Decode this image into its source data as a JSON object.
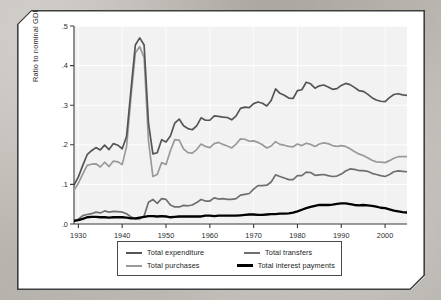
{
  "chart_data": {
    "type": "line",
    "title": "",
    "xlabel": "",
    "ylabel": "Ratio to nominal GDP",
    "xlim": [
      1929,
      2005
    ],
    "ylim": [
      0.0,
      0.5
    ],
    "xticks": [
      1930,
      1940,
      1950,
      1960,
      1970,
      1980,
      1990,
      2000
    ],
    "xtick_labels": [
      "1930",
      "1940",
      "1950",
      "1960",
      "1970",
      "1980",
      "1990",
      "2000"
    ],
    "yticks": [
      0.0,
      0.1,
      0.2,
      0.3,
      0.4,
      0.5
    ],
    "ytick_labels": [
      ".0",
      ".1",
      ".2",
      ".3",
      ".4",
      ".5"
    ],
    "grid": true,
    "legend_position": "below-center",
    "x": [
      1929,
      1930,
      1931,
      1932,
      1933,
      1934,
      1935,
      1936,
      1937,
      1938,
      1939,
      1940,
      1941,
      1942,
      1943,
      1944,
      1945,
      1946,
      1947,
      1948,
      1949,
      1950,
      1951,
      1952,
      1953,
      1954,
      1955,
      1956,
      1957,
      1958,
      1959,
      1960,
      1961,
      1962,
      1963,
      1964,
      1965,
      1966,
      1967,
      1968,
      1969,
      1970,
      1971,
      1972,
      1973,
      1974,
      1975,
      1976,
      1977,
      1978,
      1979,
      1980,
      1981,
      1982,
      1983,
      1984,
      1985,
      1986,
      1987,
      1988,
      1989,
      1990,
      1991,
      1992,
      1993,
      1994,
      1995,
      1996,
      1997,
      1998,
      1999,
      2000,
      2001,
      2002,
      2003,
      2004,
      2005
    ],
    "series": [
      {
        "name": "Total expenditure",
        "color": "#555555",
        "width": 1.7,
        "values": [
          0.098,
          0.119,
          0.148,
          0.175,
          0.185,
          0.193,
          0.187,
          0.199,
          0.188,
          0.203,
          0.199,
          0.19,
          0.221,
          0.338,
          0.452,
          0.47,
          0.452,
          0.255,
          0.177,
          0.18,
          0.213,
          0.207,
          0.222,
          0.255,
          0.265,
          0.248,
          0.241,
          0.238,
          0.248,
          0.268,
          0.262,
          0.262,
          0.273,
          0.272,
          0.27,
          0.269,
          0.263,
          0.273,
          0.292,
          0.295,
          0.294,
          0.304,
          0.308,
          0.305,
          0.298,
          0.312,
          0.341,
          0.33,
          0.325,
          0.318,
          0.317,
          0.337,
          0.339,
          0.358,
          0.354,
          0.343,
          0.349,
          0.351,
          0.346,
          0.34,
          0.342,
          0.35,
          0.355,
          0.352,
          0.345,
          0.337,
          0.335,
          0.328,
          0.319,
          0.313,
          0.31,
          0.309,
          0.319,
          0.327,
          0.329,
          0.326,
          0.325
        ]
      },
      {
        "name": "Total purchases",
        "color": "#9a9a9a",
        "width": 1.7,
        "values": [
          0.085,
          0.103,
          0.126,
          0.148,
          0.151,
          0.152,
          0.144,
          0.156,
          0.145,
          0.159,
          0.157,
          0.15,
          0.196,
          0.32,
          0.432,
          0.448,
          0.42,
          0.21,
          0.12,
          0.125,
          0.155,
          0.15,
          0.185,
          0.213,
          0.212,
          0.19,
          0.18,
          0.179,
          0.188,
          0.202,
          0.196,
          0.193,
          0.203,
          0.206,
          0.201,
          0.197,
          0.192,
          0.202,
          0.215,
          0.214,
          0.209,
          0.21,
          0.206,
          0.2,
          0.192,
          0.197,
          0.208,
          0.201,
          0.199,
          0.196,
          0.195,
          0.202,
          0.198,
          0.204,
          0.201,
          0.196,
          0.202,
          0.205,
          0.203,
          0.198,
          0.196,
          0.198,
          0.196,
          0.19,
          0.183,
          0.177,
          0.173,
          0.167,
          0.161,
          0.157,
          0.156,
          0.155,
          0.16,
          0.166,
          0.17,
          0.17,
          0.17
        ]
      },
      {
        "name": "Total transfers",
        "color": "#6f6f6f",
        "width": 1.7,
        "values": [
          0.009,
          0.012,
          0.021,
          0.024,
          0.026,
          0.03,
          0.028,
          0.033,
          0.03,
          0.032,
          0.031,
          0.03,
          0.026,
          0.018,
          0.013,
          0.013,
          0.02,
          0.055,
          0.062,
          0.052,
          0.064,
          0.062,
          0.048,
          0.043,
          0.043,
          0.047,
          0.046,
          0.048,
          0.054,
          0.062,
          0.058,
          0.058,
          0.066,
          0.063,
          0.064,
          0.062,
          0.062,
          0.064,
          0.073,
          0.075,
          0.077,
          0.088,
          0.097,
          0.097,
          0.098,
          0.106,
          0.124,
          0.12,
          0.116,
          0.112,
          0.112,
          0.122,
          0.122,
          0.131,
          0.13,
          0.123,
          0.124,
          0.125,
          0.122,
          0.12,
          0.121,
          0.126,
          0.134,
          0.139,
          0.138,
          0.135,
          0.135,
          0.133,
          0.128,
          0.125,
          0.122,
          0.12,
          0.125,
          0.132,
          0.134,
          0.133,
          0.132
        ]
      },
      {
        "name": "Total interest payments",
        "color": "#000000",
        "width": 2.3,
        "values": [
          0.008,
          0.01,
          0.013,
          0.017,
          0.018,
          0.018,
          0.017,
          0.017,
          0.016,
          0.017,
          0.017,
          0.017,
          0.016,
          0.014,
          0.014,
          0.016,
          0.018,
          0.02,
          0.02,
          0.019,
          0.02,
          0.019,
          0.017,
          0.018,
          0.019,
          0.019,
          0.019,
          0.019,
          0.019,
          0.019,
          0.021,
          0.021,
          0.02,
          0.021,
          0.021,
          0.021,
          0.021,
          0.021,
          0.022,
          0.023,
          0.024,
          0.024,
          0.023,
          0.023,
          0.024,
          0.025,
          0.025,
          0.026,
          0.026,
          0.027,
          0.029,
          0.032,
          0.036,
          0.04,
          0.043,
          0.046,
          0.048,
          0.048,
          0.048,
          0.049,
          0.051,
          0.052,
          0.052,
          0.05,
          0.048,
          0.047,
          0.048,
          0.047,
          0.046,
          0.044,
          0.041,
          0.04,
          0.037,
          0.034,
          0.032,
          0.03,
          0.029
        ]
      }
    ]
  },
  "legend": {
    "items": [
      {
        "label": "Total expenditure",
        "color": "#555555",
        "width": 2.2
      },
      {
        "label": "Total transfers",
        "color": "#6f6f6f",
        "width": 2.2
      },
      {
        "label": "Total purchases",
        "color": "#9a9a9a",
        "width": 2.2
      },
      {
        "label": "Total interest payments",
        "color": "#000000",
        "width": 3.0
      }
    ]
  },
  "axis": {
    "y_title": "Ratio to nominal GDP"
  },
  "colors": {
    "plot_background": "#f2f2f2",
    "gridline": "#ffffff",
    "axis_line": "#3a3a3a",
    "frame": "#3f3f3f",
    "page": "#ffffff"
  }
}
